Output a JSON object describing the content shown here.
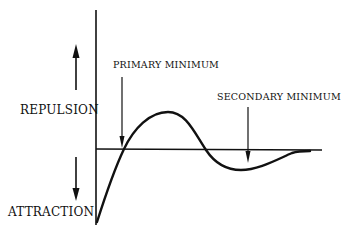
{
  "diagram": {
    "type": "potential-energy-curve",
    "labels": {
      "repulsion": "REPULSION",
      "attraction": "ATTRACTION",
      "primary_minimum": "PRIMARY MINIMUM",
      "secondary_minimum": "SECONDARY MINIMUM"
    },
    "arrows": {
      "repulsion_direction": "up",
      "attraction_direction": "down"
    },
    "colors": {
      "stroke": "#111111",
      "background": "#ffffff"
    }
  }
}
